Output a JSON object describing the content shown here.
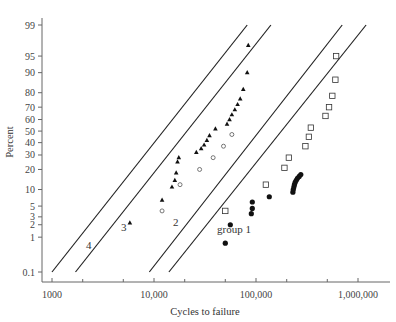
{
  "chart_data": {
    "type": "scatter",
    "title": "",
    "xlabel": "Cycles to failure",
    "ylabel": "Percent",
    "xscale": "log",
    "yscale": "probability (normal)",
    "xlim": [
      1000,
      1500000
    ],
    "ylim": [
      0.1,
      99
    ],
    "x_ticks": [
      "1000",
      "10,000",
      "100,000",
      "1,000,000"
    ],
    "y_ticks": [
      "0.1",
      "1",
      "2",
      "3",
      "5",
      "10",
      "20",
      "30",
      "40",
      "50",
      "60",
      "70",
      "80",
      "90",
      "95",
      "99"
    ],
    "grid": false,
    "legend": null,
    "annotations": [
      "4",
      "3",
      "2",
      "group 1"
    ],
    "series": [
      {
        "name": "group 1",
        "marker": "filled circle",
        "fit_line": {
          "x": [
            14000,
            1200000
          ],
          "y": [
            0.1,
            99
          ]
        },
        "points": [
          {
            "x": 50000,
            "y": 0.7
          },
          {
            "x": 56000,
            "y": 2
          },
          {
            "x": 90000,
            "y": 3.5
          },
          {
            "x": 92000,
            "y": 4.5
          },
          {
            "x": 92000,
            "y": 6
          },
          {
            "x": 135000,
            "y": 7.5
          },
          {
            "x": 230000,
            "y": 9
          },
          {
            "x": 232000,
            "y": 10
          },
          {
            "x": 235000,
            "y": 11
          },
          {
            "x": 238000,
            "y": 12
          },
          {
            "x": 242000,
            "y": 13
          },
          {
            "x": 248000,
            "y": 14
          },
          {
            "x": 255000,
            "y": 15
          },
          {
            "x": 265000,
            "y": 16
          },
          {
            "x": 275000,
            "y": 17
          }
        ]
      },
      {
        "name": "group 2",
        "marker": "open square",
        "fit_line": {
          "x": [
            9000,
            700000
          ],
          "y": [
            0.1,
            99
          ]
        },
        "points": [
          {
            "x": 50000,
            "y": 4
          },
          {
            "x": 125000,
            "y": 12
          },
          {
            "x": 190000,
            "y": 21
          },
          {
            "x": 210000,
            "y": 28
          },
          {
            "x": 305000,
            "y": 37
          },
          {
            "x": 330000,
            "y": 45
          },
          {
            "x": 345000,
            "y": 53
          },
          {
            "x": 480000,
            "y": 63
          },
          {
            "x": 520000,
            "y": 70
          },
          {
            "x": 560000,
            "y": 78
          },
          {
            "x": 600000,
            "y": 87
          },
          {
            "x": 610000,
            "y": 95
          }
        ]
      },
      {
        "name": "group 3",
        "marker": "open diamond",
        "fit_line": {
          "x": [
            1700,
            140000
          ],
          "y": [
            0.1,
            99
          ]
        },
        "points": [
          {
            "x": 12000,
            "y": 4
          },
          {
            "x": 18000,
            "y": 12
          },
          {
            "x": 28000,
            "y": 20
          },
          {
            "x": 38000,
            "y": 28
          },
          {
            "x": 48000,
            "y": 37
          },
          {
            "x": 58000,
            "y": 47
          }
        ]
      },
      {
        "name": "group 4",
        "marker": "filled triangle",
        "fit_line": {
          "x": [
            1000,
            82000
          ],
          "y": [
            0.1,
            99
          ]
        },
        "points": [
          {
            "x": 5800,
            "y": 2.2
          },
          {
            "x": 12000,
            "y": 6.5
          },
          {
            "x": 15000,
            "y": 11
          },
          {
            "x": 16000,
            "y": 14
          },
          {
            "x": 16500,
            "y": 18
          },
          {
            "x": 17000,
            "y": 25
          },
          {
            "x": 17500,
            "y": 28
          },
          {
            "x": 26000,
            "y": 32
          },
          {
            "x": 29000,
            "y": 35
          },
          {
            "x": 31000,
            "y": 38
          },
          {
            "x": 33000,
            "y": 42
          },
          {
            "x": 35000,
            "y": 46
          },
          {
            "x": 40000,
            "y": 52
          },
          {
            "x": 52000,
            "y": 56
          },
          {
            "x": 55000,
            "y": 60
          },
          {
            "x": 58000,
            "y": 64
          },
          {
            "x": 62000,
            "y": 68
          },
          {
            "x": 66000,
            "y": 72
          },
          {
            "x": 70000,
            "y": 76
          },
          {
            "x": 75000,
            "y": 82
          },
          {
            "x": 82000,
            "y": 90
          },
          {
            "x": 84000,
            "y": 97
          }
        ]
      }
    ]
  },
  "labels": {
    "ylabel": "Percent",
    "xlabel": "Cycles to failure",
    "line4": "4",
    "line3": "3",
    "line2": "2",
    "group1": "group 1"
  }
}
